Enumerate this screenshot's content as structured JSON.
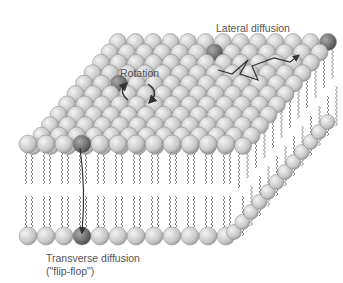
{
  "labels": {
    "lateral": "Lateral diffusion",
    "rotation": "Rotation",
    "transverse_line1": "Transverse diffusion",
    "transverse_line2": "(\"flip-flop\")"
  },
  "colors": {
    "head": "#cfcfcf",
    "head_highlight": "#707070",
    "tail": "#666666",
    "arrow": "#333333"
  }
}
